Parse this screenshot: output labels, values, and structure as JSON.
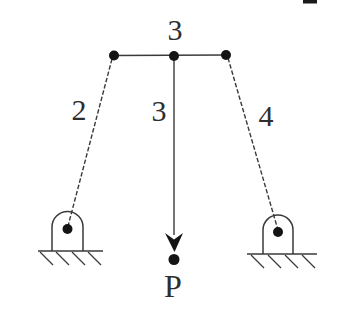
{
  "figure": {
    "type": "statics-truss-diagram",
    "top_joint_label": "3",
    "members": [
      {
        "name": "left-member",
        "label": "2"
      },
      {
        "name": "middle-member",
        "label": "3"
      },
      {
        "name": "right-member",
        "label": "4"
      }
    ],
    "load_label": "P",
    "supports": [
      {
        "name": "left-pinned-support",
        "style": "pin-in-arch-on-hatched-ground"
      },
      {
        "name": "right-pinned-support",
        "style": "pin-in-arch-on-hatched-ground"
      }
    ],
    "colors": {
      "line": "#3a3a3a",
      "node": "#141414",
      "text": "#2e2e2e",
      "background": "#ffffff"
    }
  }
}
